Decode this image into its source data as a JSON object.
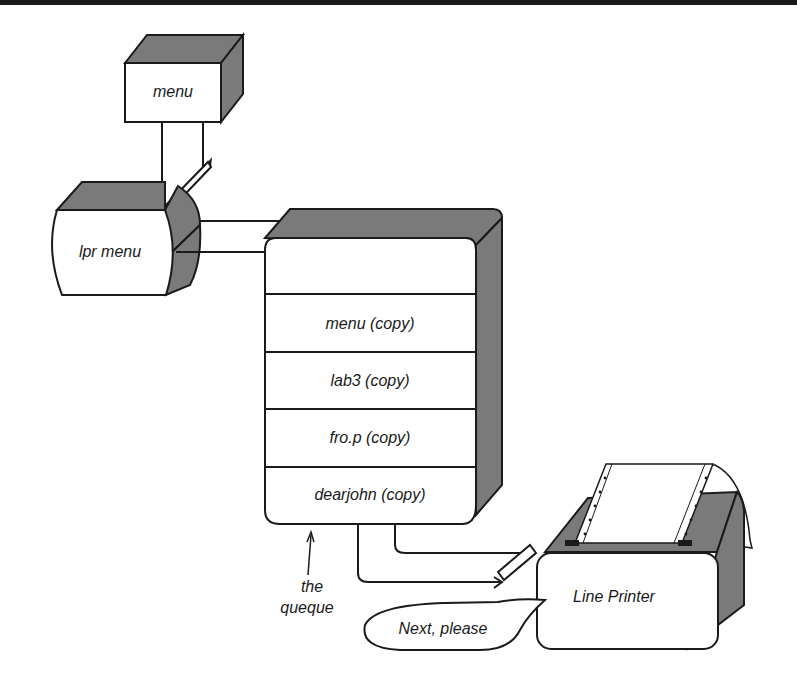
{
  "colors": {
    "ink": "#1a1a1a",
    "shade": "#7a7a7a",
    "paper": "#ffffff"
  },
  "source_box": {
    "label": "menu"
  },
  "command_box": {
    "label": "lpr menu"
  },
  "queue": {
    "slots": [
      {
        "label": "menu (copy)"
      },
      {
        "label": "lab3 (copy)"
      },
      {
        "label": "fro.p (copy)"
      },
      {
        "label": "dearjohn (copy)"
      }
    ],
    "caption_line1": "the",
    "caption_line2": "queque"
  },
  "printer": {
    "label": "Line Printer"
  },
  "speech_bubble": {
    "text": "Next, please"
  }
}
